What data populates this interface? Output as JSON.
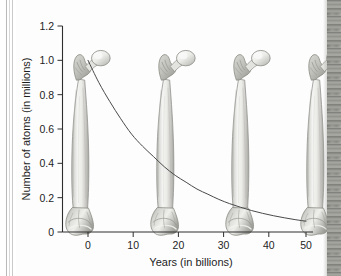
{
  "figure": {
    "kind": "scanned-textbook-figure",
    "caption": ""
  },
  "chart_data": {
    "type": "line",
    "title": "",
    "subtitle": "",
    "xlabel": "Years (in billions)",
    "ylabel": "Number of atoms (in millions)",
    "xlim": [
      -6,
      52
    ],
    "ylim": [
      0,
      1.2
    ],
    "xticks": [
      "0",
      "10",
      "20",
      "30",
      "40",
      "50"
    ],
    "xtick_values": [
      0,
      10,
      20,
      30,
      40,
      50
    ],
    "yticks": [
      "0",
      "0.2",
      "0.4",
      "0.6",
      "0.8",
      "1.0",
      "1.2"
    ],
    "ytick_values": [
      0,
      0.2,
      0.4,
      0.6,
      0.8,
      1.0,
      1.2
    ],
    "grid": false,
    "legend": null,
    "series": [
      {
        "name": "Number of atoms remaining",
        "curve": "exponential-decay",
        "half_life_billions_of_years": 12.5,
        "x": [
          0,
          2.5,
          5,
          7.5,
          10,
          12.5,
          15,
          17.5,
          20,
          22.5,
          25,
          27.5,
          30,
          32.5,
          35,
          37.5,
          40,
          42.5,
          45,
          47.5,
          50
        ],
        "values": [
          1.0,
          0.87,
          0.76,
          0.66,
          0.57,
          0.5,
          0.44,
          0.38,
          0.33,
          0.29,
          0.25,
          0.22,
          0.19,
          0.165,
          0.144,
          0.125,
          0.109,
          0.095,
          0.083,
          0.072,
          0.063
        ]
      }
    ],
    "annotations": [
      {
        "label": "bone-illustration",
        "x": -3,
        "note": "femur at start"
      },
      {
        "label": "bone-illustration",
        "x": 13,
        "note": "femur after one half-life"
      },
      {
        "label": "bone-illustration",
        "x": 27,
        "note": "femur after two half-lives"
      },
      {
        "label": "bone-illustration",
        "x": 41,
        "note": "femur after three half-lives"
      }
    ]
  },
  "colors": {
    "axis": "#2e2e2e",
    "curve": "#4a4a4a",
    "bone_light": "#f2f2f0",
    "bone_mid": "#d2d2cf",
    "bone_dark": "#a9a9a5",
    "bone_outline": "#8a8a86",
    "page": "#fdfdfd",
    "edge_strip": "#8d8d89"
  }
}
